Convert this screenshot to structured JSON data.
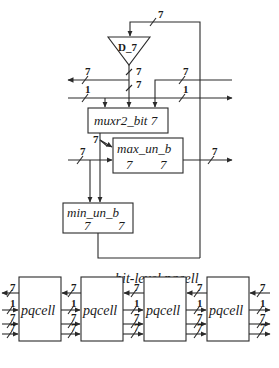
{
  "top_diagram": {
    "title": "bit-level pqcell",
    "register": {
      "label": "D_7",
      "input_width": "7",
      "output_width": "7"
    },
    "buses": [
      {
        "name": "bus-7-left",
        "width": "7"
      },
      {
        "name": "bus-1-left",
        "width": "1"
      },
      {
        "name": "bus-7-right",
        "width": "7"
      },
      {
        "name": "bus-1-right",
        "width": "1"
      },
      {
        "name": "register-out",
        "width": "7"
      }
    ],
    "blocks": {
      "mux": {
        "label": "muxr2_bit 7"
      },
      "max": {
        "label": "max_un_b",
        "port_a": "7",
        "port_b": "7",
        "sel_width": "7",
        "in_width": "7",
        "out_width": "7"
      },
      "min": {
        "label": "min_un_b",
        "port_a": "7",
        "port_b": "7"
      }
    }
  },
  "bottom_diagram": {
    "cells": [
      {
        "label": "pqcell"
      },
      {
        "label": "pqcell"
      },
      {
        "label": "pqcell"
      },
      {
        "label": "pqcell"
      }
    ],
    "port_widths": [
      "7",
      "1",
      "7",
      "7"
    ]
  }
}
